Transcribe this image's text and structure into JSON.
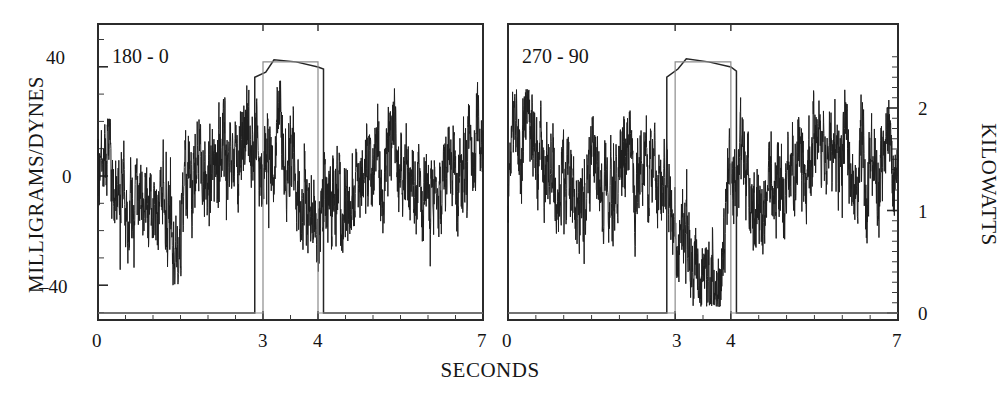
{
  "figure": {
    "xlabel": "SECONDS",
    "ylabel_left": "MILLIGRAMS/DYNES",
    "ylabel_right": "KILOWATTS"
  },
  "panels": [
    {
      "id": "left",
      "label": "180 - 0"
    },
    {
      "id": "right",
      "label": "270 - 90"
    }
  ],
  "axes": {
    "x_ticks_left": [
      "0",
      "3",
      "4",
      "7"
    ],
    "x_ticks_right": [
      "0",
      "3",
      "4",
      "7"
    ],
    "y_ticks_left": [
      "40",
      "0",
      "–40"
    ],
    "y_ticks_right": [
      "2",
      "1",
      "0"
    ]
  },
  "chart_data": {
    "type": "line",
    "title": "",
    "subtitle": "",
    "xlabel": "SECONDS",
    "ylabel": "MILLIGRAMS/DYNES",
    "ylabel_secondary": "KILOWATTS",
    "grid": false,
    "legend": "none",
    "n_panels": 2,
    "xlim": [
      0,
      7
    ],
    "ylim_left": [
      -60,
      52
    ],
    "ylim_right": [
      -0.2,
      2.55
    ],
    "x_ticks": [
      0,
      3,
      4,
      7
    ],
    "x_tick_labels": [
      "0",
      "3",
      "4",
      "7"
    ],
    "y_ticks_left": [
      40,
      0,
      -40
    ],
    "y_tick_labels_left": [
      "40",
      "0",
      "–40"
    ],
    "y_ticks_right": [
      2,
      1,
      0
    ],
    "y_tick_labels_right": [
      "2",
      "1",
      "0"
    ],
    "minor_ticks": true,
    "panels": [
      {
        "name": "180 - 0",
        "annotation": "180 - 0",
        "series": [
          {
            "name": "force-signal",
            "axis": "left",
            "units": "milligrams/dynes",
            "description": "high-frequency noisy force trace oscillating about 0, envelope roughly -40 to +35, with elevated activity near t=2.8-3.2 s and a depressed excursion near t=4.0-4.5 s",
            "mean": 0,
            "approx_envelope": [
              -40,
              35
            ],
            "segment_means": [
              {
                "t": [
                  0.0,
                  0.5
                ],
                "y": 5
              },
              {
                "t": [
                  0.5,
                  1.0
                ],
                "y": -8
              },
              {
                "t": [
                  1.0,
                  1.5
                ],
                "y": -5
              },
              {
                "t": [
                  1.5,
                  2.0
                ],
                "y": -14
              },
              {
                "t": [
                  2.0,
                  2.5
                ],
                "y": 6
              },
              {
                "t": [
                  2.5,
                  3.0
                ],
                "y": 10
              },
              {
                "t": [
                  3.0,
                  3.5
                ],
                "y": 12
              },
              {
                "t": [
                  3.5,
                  4.0
                ],
                "y": -2
              },
              {
                "t": [
                  4.0,
                  4.5
                ],
                "y": -18
              },
              {
                "t": [
                  4.5,
                  5.0
                ],
                "y": -6
              },
              {
                "t": [
                  5.0,
                  5.5
                ],
                "y": 0
              },
              {
                "t": [
                  5.5,
                  6.0
                ],
                "y": 4
              },
              {
                "t": [
                  6.0,
                  6.5
                ],
                "y": -8
              },
              {
                "t": [
                  6.5,
                  7.0
                ],
                "y": 6
              }
            ]
          },
          {
            "name": "power-pulse",
            "axis": "right",
            "units": "kilowatts",
            "description": "rectangular power pulse: 0 kW baseline, rises at t=2.85 s to a plateau near 2.45 kW, returns to 0 kW at t=4.1 s",
            "baseline_kw": 0,
            "plateau_kw": 2.45,
            "rise_time_s": 2.85,
            "fall_time_s": 4.1,
            "points": [
              {
                "t": 0.0,
                "kw": 0.0
              },
              {
                "t": 2.85,
                "kw": 0.0
              },
              {
                "t": 2.85,
                "kw": 2.3
              },
              {
                "t": 3.05,
                "kw": 2.35
              },
              {
                "t": 3.2,
                "kw": 2.47
              },
              {
                "t": 3.6,
                "kw": 2.45
              },
              {
                "t": 4.0,
                "kw": 2.4
              },
              {
                "t": 4.1,
                "kw": 2.38
              },
              {
                "t": 4.1,
                "kw": 0.0
              },
              {
                "t": 7.0,
                "kw": 0.0
              }
            ]
          },
          {
            "name": "power-pulse-second",
            "axis": "right",
            "units": "kilowatts",
            "description": "second overlapping rectangular pulse slightly offset, rises at t=3.0 s and falls at t=4.0 s",
            "baseline_kw": 0,
            "plateau_kw": 2.45,
            "rise_time_s": 3.0,
            "fall_time_s": 4.0
          }
        ]
      },
      {
        "name": "270 - 90",
        "annotation": "270 - 90",
        "series": [
          {
            "name": "force-signal",
            "axis": "left",
            "units": "milligrams/dynes",
            "description": "high-frequency noisy force trace about 0 with a pronounced sustained negative excursion between t=3.2 and t=4.0 s reaching about -45, and a high-amplitude burst near t=5.8-6.4 s reaching about +30",
            "mean": 0,
            "approx_envelope": [
              -48,
              32
            ],
            "segment_means": [
              {
                "t": [
                  0.0,
                  0.5
                ],
                "y": 2
              },
              {
                "t": [
                  0.5,
                  1.0
                ],
                "y": 6
              },
              {
                "t": [
                  1.0,
                  1.5
                ],
                "y": -6
              },
              {
                "t": [
                  1.5,
                  2.0
                ],
                "y": -4
              },
              {
                "t": [
                  2.0,
                  2.5
                ],
                "y": -2
              },
              {
                "t": [
                  2.5,
                  3.0
                ],
                "y": 3
              },
              {
                "t": [
                  3.0,
                  3.3
                ],
                "y": -6
              },
              {
                "t": [
                  3.3,
                  3.8
                ],
                "y": -30
              },
              {
                "t": [
                  3.8,
                  4.0
                ],
                "y": -40
              },
              {
                "t": [
                  4.0,
                  4.5
                ],
                "y": -4
              },
              {
                "t": [
                  4.5,
                  5.0
                ],
                "y": -6
              },
              {
                "t": [
                  5.0,
                  5.5
                ],
                "y": -8
              },
              {
                "t": [
                  5.5,
                  6.2
                ],
                "y": 12
              },
              {
                "t": [
                  6.2,
                  7.0
                ],
                "y": 6
              }
            ]
          },
          {
            "name": "power-pulse",
            "axis": "right",
            "units": "kilowatts",
            "description": "rectangular power pulse: 0 kW baseline, rises at t=2.85 s to a plateau near 2.45 kW, returns to 0 kW at t=4.1 s",
            "baseline_kw": 0,
            "plateau_kw": 2.45,
            "rise_time_s": 2.85,
            "fall_time_s": 4.1,
            "points": [
              {
                "t": 0.0,
                "kw": 0.0
              },
              {
                "t": 2.85,
                "kw": 0.0
              },
              {
                "t": 2.85,
                "kw": 2.3
              },
              {
                "t": 3.05,
                "kw": 2.38
              },
              {
                "t": 3.2,
                "kw": 2.48
              },
              {
                "t": 3.6,
                "kw": 2.45
              },
              {
                "t": 4.0,
                "kw": 2.4
              },
              {
                "t": 4.1,
                "kw": 2.36
              },
              {
                "t": 4.1,
                "kw": 0.0
              },
              {
                "t": 7.0,
                "kw": 0.0
              }
            ]
          },
          {
            "name": "power-pulse-second",
            "axis": "right",
            "units": "kilowatts",
            "description": "second overlapping rectangular pulse slightly offset, rises at t=3.0 s and falls at t=4.0 s",
            "baseline_kw": 0,
            "plateau_kw": 2.45,
            "rise_time_s": 3.0,
            "fall_time_s": 4.0
          }
        ]
      }
    ]
  }
}
